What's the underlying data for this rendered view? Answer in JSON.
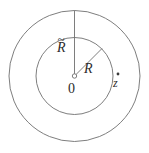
{
  "figure": {
    "kind": "annulus-diagram",
    "width": 149,
    "height": 153,
    "background_color": "#ffffff",
    "stroke_color": "#6f6f6f",
    "text_color": "#2b2b2b"
  },
  "labels": {
    "outer_radius": "R",
    "outer_radius_accent": "~",
    "inner_radius": "R",
    "origin": "0",
    "point": "z"
  },
  "geometry": {
    "center": {
      "x": 74.5,
      "y": 76.0
    },
    "outer_circle": {
      "radius": 65.5,
      "label": "R",
      "accent": "tilde"
    },
    "inner_circle": {
      "radius": 38.5,
      "label": "R",
      "accent": "none"
    },
    "origin_marker": {
      "radius": 2.2,
      "filled": false
    },
    "outer_radius_line": {
      "from": {
        "x": 74.5,
        "y": 76.0
      },
      "to": {
        "x": 74.5,
        "y": 10.5
      },
      "angle_deg": 90
    },
    "inner_radius_line": {
      "from": {
        "x": 74.5,
        "y": 76.0
      },
      "to": {
        "x": 102.0,
        "y": 48.5
      },
      "angle_deg": 45
    },
    "point_marker": {
      "x": 118.0,
      "y": 74.0,
      "radius": 1.4,
      "filled": true
    }
  }
}
